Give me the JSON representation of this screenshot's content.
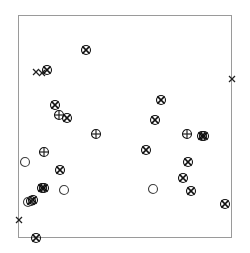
{
  "figure": {
    "type": "scatter",
    "title": "",
    "background_color": "#ffffff",
    "frame": {
      "left": 18,
      "top": 15,
      "right": 232,
      "bottom": 238,
      "width": 214,
      "height": 223,
      "border_color": "#9a9a9a",
      "border_width": 1,
      "grid": false
    },
    "axes": {
      "x_label": "",
      "y_label": "",
      "x_ticks": [],
      "y_ticks": [],
      "x_tick_labels": [],
      "y_tick_labels": []
    },
    "legend": {
      "visible": false,
      "entries": []
    }
  },
  "chart_data": {
    "type": "scatter",
    "title": "",
    "xlabel": "",
    "ylabel": "",
    "xlim": [
      18,
      232
    ],
    "ylim": [
      238,
      15
    ],
    "grid": false,
    "legend_position": "none",
    "marker_styles": {
      "circled-x": {
        "symbol": "circle-with-x",
        "color": "#111111",
        "fill": "none",
        "size": 9
      },
      "circled-plus": {
        "symbol": "circle-with-plus",
        "color": "#111111",
        "fill": "none",
        "size": 9
      },
      "open-circle": {
        "symbol": "circle",
        "color": "#3d3d3d",
        "fill": "none",
        "size": 9
      },
      "x": {
        "symbol": "x",
        "color": "#111111",
        "fill": "none",
        "size": 6
      }
    },
    "series": [
      {
        "name": "circled-x",
        "marker": "circled-x",
        "count": 19,
        "points": [
          {
            "x": 86,
            "y": 50
          },
          {
            "x": 47,
            "y": 70
          },
          {
            "x": 55,
            "y": 105
          },
          {
            "x": 67,
            "y": 118
          },
          {
            "x": 161,
            "y": 100
          },
          {
            "x": 155,
            "y": 120
          },
          {
            "x": 202,
            "y": 136
          },
          {
            "x": 146,
            "y": 150
          },
          {
            "x": 188,
            "y": 162
          },
          {
            "x": 60,
            "y": 170
          },
          {
            "x": 183,
            "y": 178
          },
          {
            "x": 44,
            "y": 188
          },
          {
            "x": 191,
            "y": 191
          },
          {
            "x": 33,
            "y": 200
          },
          {
            "x": 225,
            "y": 204
          },
          {
            "x": 36,
            "y": 238
          },
          {
            "x": 42,
            "y": 188
          },
          {
            "x": 204,
            "y": 136
          },
          {
            "x": 31,
            "y": 201
          }
        ]
      },
      {
        "name": "circled-plus",
        "marker": "circled-plus",
        "count": 4,
        "points": [
          {
            "x": 59,
            "y": 115
          },
          {
            "x": 96,
            "y": 134
          },
          {
            "x": 44,
            "y": 152
          },
          {
            "x": 187,
            "y": 134
          }
        ]
      },
      {
        "name": "open-circle",
        "marker": "open-circle",
        "count": 4,
        "points": [
          {
            "x": 25,
            "y": 162
          },
          {
            "x": 64,
            "y": 190
          },
          {
            "x": 28,
            "y": 202
          },
          {
            "x": 153,
            "y": 189
          }
        ]
      },
      {
        "name": "x",
        "marker": "x",
        "count": 4,
        "points": [
          {
            "x": 36,
            "y": 72
          },
          {
            "x": 42,
            "y": 73
          },
          {
            "x": 232,
            "y": 79
          },
          {
            "x": 19,
            "y": 220
          }
        ]
      }
    ]
  }
}
